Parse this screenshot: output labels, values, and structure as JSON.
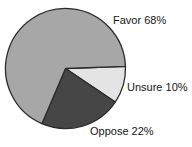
{
  "figure": {
    "background_color": "#ffffff",
    "text_color": "#161616"
  },
  "chart_data": {
    "type": "pie",
    "title": "",
    "categories": [
      "Favor",
      "Unsure",
      "Oppose"
    ],
    "values": [
      68,
      10,
      22
    ],
    "unit": "%",
    "legend_position": "none",
    "inline_labels": true,
    "start_angle_deg": 2,
    "direction": "clockwise",
    "outline_color": "#2b2b2b",
    "slices": [
      {
        "label": "Unsure",
        "value": 10,
        "label_text": "Unsure 10%",
        "color": "#e4e4e4"
      },
      {
        "label": "Oppose",
        "value": 22,
        "label_text": "Oppose 22%",
        "color": "#464646"
      },
      {
        "label": "Favor",
        "value": 68,
        "label_text": "Favor 68%",
        "color": "#a7a7a7"
      }
    ]
  }
}
